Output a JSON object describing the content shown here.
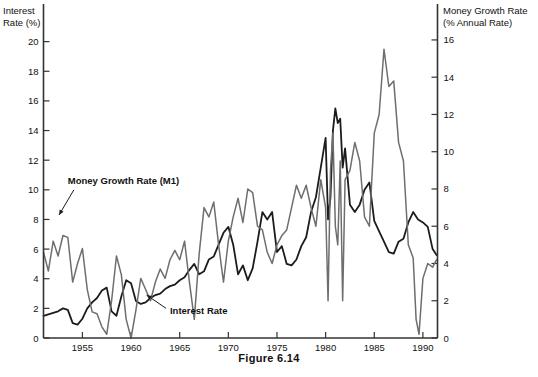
{
  "caption": "Figure 6.14",
  "left_axis": {
    "title_line1": "Interest",
    "title_line2": "Rate (%)",
    "ticks": [
      "0",
      "2",
      "4",
      "6",
      "8",
      "10",
      "12",
      "14",
      "16",
      "18",
      "20"
    ]
  },
  "right_axis": {
    "title_line1": "Money Growth Rate",
    "title_line2": "(% Annual Rate)",
    "ticks": [
      "0",
      "2",
      "4",
      "6",
      "8",
      "10",
      "12",
      "14",
      "16"
    ]
  },
  "x_axis": {
    "ticks": [
      "1955",
      "1960",
      "1965",
      "1970",
      "1975",
      "1980",
      "1985",
      "1990"
    ]
  },
  "annotations": {
    "money": "Money Growth Rate (M1)",
    "interest": "Interest Rate"
  },
  "colors": {
    "interest_line": "#1c1c1c",
    "money_line": "#6e6e6e",
    "axis": "#333333",
    "text": "#111111",
    "background": "#ffffff"
  },
  "chart_data": {
    "type": "line",
    "title": "",
    "subtitle": "",
    "xlabel": "",
    "ylabel": "Interest Rate (%)",
    "y2label": "Money Growth Rate (% Annual Rate)",
    "xlim": [
      1951.0,
      1991.5
    ],
    "ylim": [
      0,
      22
    ],
    "y2lim": [
      0,
      17.5
    ],
    "ytick_values": [
      0,
      2,
      4,
      6,
      8,
      10,
      12,
      14,
      16,
      18,
      20
    ],
    "y2tick_values": [
      0,
      2,
      4,
      6,
      8,
      10,
      12,
      14,
      16
    ],
    "xtick_values": [
      1955,
      1960,
      1965,
      1970,
      1975,
      1980,
      1985,
      1990
    ],
    "grid": false,
    "legend": "inline-annotations",
    "series": [
      {
        "name": "Interest Rate",
        "axis": "left",
        "color": "#1c1c1c",
        "unit": "%",
        "x": [
          1951.0,
          1951.5,
          1952.0,
          1952.5,
          1953.0,
          1953.5,
          1954.0,
          1954.5,
          1955.0,
          1955.5,
          1956.0,
          1956.5,
          1957.0,
          1957.5,
          1958.0,
          1958.5,
          1959.0,
          1959.5,
          1960.0,
          1960.5,
          1961.0,
          1961.5,
          1962.0,
          1962.5,
          1963.0,
          1963.5,
          1964.0,
          1964.5,
          1965.0,
          1965.5,
          1966.0,
          1966.5,
          1967.0,
          1967.5,
          1968.0,
          1968.5,
          1969.0,
          1969.5,
          1970.0,
          1970.5,
          1971.0,
          1971.5,
          1972.0,
          1972.5,
          1973.0,
          1973.5,
          1974.0,
          1974.5,
          1975.0,
          1975.5,
          1976.0,
          1976.5,
          1977.0,
          1977.5,
          1978.0,
          1978.5,
          1979.0,
          1979.5,
          1980.0,
          1980.25,
          1980.5,
          1980.75,
          1981.0,
          1981.25,
          1981.5,
          1981.75,
          1982.0,
          1982.5,
          1983.0,
          1983.5,
          1984.0,
          1984.5,
          1985.0,
          1985.5,
          1986.0,
          1986.5,
          1987.0,
          1987.5,
          1988.0,
          1988.5,
          1989.0,
          1989.5,
          1990.0,
          1990.5,
          1991.0,
          1991.4
        ],
        "values": [
          1.5,
          1.6,
          1.7,
          1.8,
          2.0,
          1.9,
          1.0,
          0.9,
          1.3,
          2.0,
          2.4,
          2.7,
          3.2,
          3.4,
          1.8,
          1.5,
          2.8,
          3.9,
          3.7,
          2.5,
          2.3,
          2.4,
          2.7,
          2.9,
          3.0,
          3.3,
          3.5,
          3.6,
          3.9,
          4.1,
          4.6,
          5.0,
          4.3,
          4.5,
          5.3,
          5.5,
          6.3,
          7.1,
          7.5,
          6.3,
          4.3,
          4.9,
          3.9,
          4.7,
          6.5,
          8.5,
          8.0,
          8.5,
          5.8,
          6.2,
          5.0,
          4.9,
          5.3,
          6.2,
          6.8,
          8.5,
          9.5,
          11.5,
          13.5,
          8.0,
          9.5,
          14.0,
          15.5,
          14.5,
          14.8,
          11.5,
          12.8,
          9.0,
          8.5,
          9.0,
          10.0,
          10.5,
          7.9,
          7.2,
          6.5,
          5.8,
          5.7,
          6.5,
          6.7,
          7.8,
          8.5,
          8.0,
          7.8,
          7.5,
          6.0,
          5.6
        ]
      },
      {
        "name": "Money Growth Rate (M1)",
        "axis": "right",
        "color": "#6e6e6e",
        "unit": "% annual",
        "x": [
          1951.0,
          1951.5,
          1952.0,
          1952.5,
          1953.0,
          1953.5,
          1954.0,
          1954.5,
          1955.0,
          1955.5,
          1956.0,
          1956.5,
          1957.0,
          1957.5,
          1958.0,
          1958.5,
          1959.0,
          1959.5,
          1960.0,
          1960.5,
          1961.0,
          1961.5,
          1962.0,
          1962.5,
          1963.0,
          1963.5,
          1964.0,
          1964.5,
          1965.0,
          1965.5,
          1966.0,
          1966.5,
          1967.0,
          1967.5,
          1968.0,
          1968.5,
          1969.0,
          1969.5,
          1970.0,
          1970.5,
          1971.0,
          1971.5,
          1972.0,
          1972.5,
          1973.0,
          1973.5,
          1974.0,
          1974.5,
          1975.0,
          1975.5,
          1976.0,
          1976.5,
          1977.0,
          1977.5,
          1978.0,
          1978.5,
          1979.0,
          1979.5,
          1980.0,
          1980.25,
          1980.5,
          1980.75,
          1981.0,
          1981.25,
          1981.5,
          1981.75,
          1982.0,
          1982.5,
          1983.0,
          1983.5,
          1984.0,
          1984.5,
          1985.0,
          1985.5,
          1986.0,
          1986.5,
          1987.0,
          1987.5,
          1988.0,
          1988.5,
          1989.0,
          1989.3,
          1989.6,
          1990.0,
          1990.5,
          1991.0,
          1991.4
        ],
        "values": [
          4.6,
          3.6,
          5.2,
          4.4,
          5.5,
          5.4,
          3.0,
          4.0,
          4.8,
          2.6,
          1.4,
          1.3,
          0.6,
          0.2,
          2.0,
          4.4,
          3.4,
          1.0,
          0.0,
          1.5,
          3.2,
          2.6,
          2.0,
          3.0,
          3.7,
          3.2,
          4.2,
          4.7,
          4.2,
          5.2,
          3.0,
          1.0,
          4.5,
          7.0,
          6.5,
          7.3,
          5.0,
          3.0,
          5.2,
          6.5,
          7.5,
          6.2,
          8.0,
          7.8,
          6.0,
          5.8,
          4.6,
          4.0,
          5.0,
          5.5,
          5.8,
          7.0,
          8.2,
          7.5,
          8.2,
          7.0,
          6.0,
          8.5,
          7.0,
          2.0,
          9.0,
          11.0,
          6.0,
          5.0,
          9.5,
          2.0,
          8.5,
          9.0,
          10.5,
          9.5,
          6.5,
          6.0,
          11.0,
          12.0,
          15.5,
          13.5,
          13.8,
          10.5,
          9.5,
          5.0,
          4.3,
          1.0,
          0.2,
          3.2,
          4.0,
          3.8,
          4.2
        ]
      }
    ],
    "annotations": [
      {
        "text": "Money Growth Rate (M1)",
        "x": 1953.5,
        "y": 10.4,
        "arrow_to_x": 1952.6,
        "arrow_to_y": 8.3
      },
      {
        "text": "Interest Rate",
        "x": 1964.0,
        "y": 1.6,
        "arrow_to_x": 1961.6,
        "arrow_to_y": 2.9
      }
    ]
  }
}
